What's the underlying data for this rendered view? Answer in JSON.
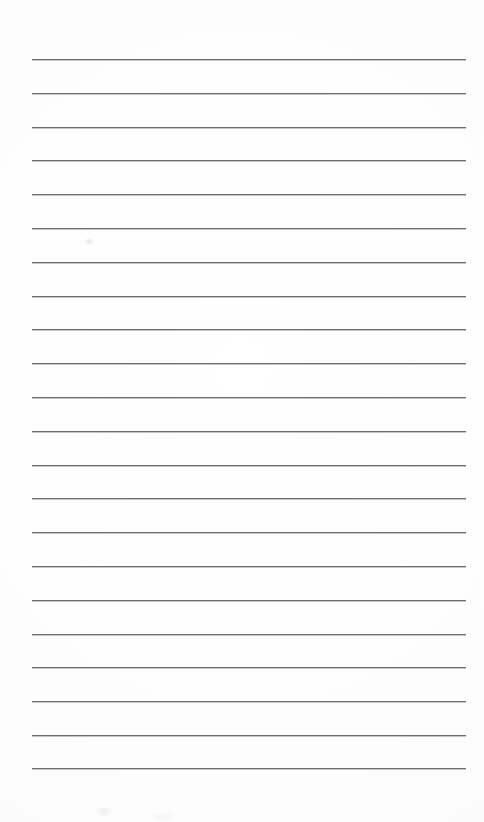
{
  "page": {
    "kind": "lined-paper-sheet",
    "width_px": 484,
    "height_px": 822,
    "background_color": "#fefefe",
    "paper_tint_color": "#fafafa",
    "has_visible_text": false,
    "has_handwriting": false,
    "content_text": ""
  },
  "ruling": {
    "label": "horizontal ruled lines",
    "line_color": "#6e6e6e",
    "line_shadow_color": "#969696",
    "line_thickness_px": 1,
    "line_count": 22,
    "left_x_px": 32,
    "right_x_px": 466,
    "line_length_px": 434,
    "first_line_y_px": 59,
    "line_spacing_px": 33.8,
    "last_line_y_px": 768,
    "line_y_positions": [
      59,
      93,
      127,
      160,
      194,
      228,
      262,
      296,
      329,
      363,
      397,
      431,
      465,
      498,
      532,
      566,
      600,
      634,
      667,
      701,
      735,
      768
    ]
  },
  "margins": {
    "top_margin_px": 59,
    "bottom_margin_px": 54,
    "left_margin_px": 32,
    "right_margin_px": 18,
    "top_label": "top blank margin",
    "bottom_label": "bottom blank margin"
  },
  "artifacts": {
    "label": "faint scan smudges",
    "marks": [
      {
        "name": "smudge-upper-left",
        "x_px": 84,
        "y_px": 238,
        "variant": "a"
      },
      {
        "name": "smudge-lower-left",
        "x_px": 96,
        "y_px": 806,
        "variant": "b"
      },
      {
        "name": "smudge-lower-center",
        "x_px": 150,
        "y_px": 812,
        "variant": "c"
      }
    ]
  }
}
